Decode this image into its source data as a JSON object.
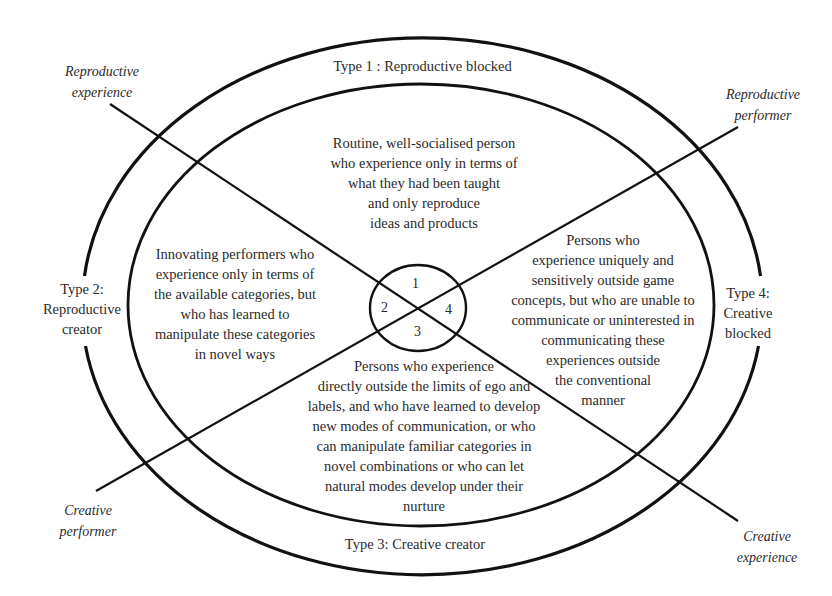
{
  "diagram": {
    "type_labels": {
      "type1": "Type 1 : Reproductive blocked",
      "type2": "Type 2:\nReproductive\ncreator",
      "type3": "Type 3: Creative creator",
      "type4": "Type 4:\nCreative\nblocked"
    },
    "axis_labels": {
      "reproductive_experience": "Reproductive\nexperience",
      "reproductive_performer": "Reproductive\nperformer",
      "creative_performer": "Creative\nperformer",
      "creative_experience": "Creative\nexperience"
    },
    "descriptions": {
      "quadrant1": "Routine, well-socialised person\nwho experience only in terms of\nwhat they had been taught\nand only reproduce\nideas and products",
      "quadrant2": "Innovating performers who\nexperience only in terms of\nthe available categories, but\nwho has learned to\nmanipulate these categories\nin novel ways",
      "quadrant3": "Persons who experience\ndirectly outside the limits of ego and\nlabels, and who have learned to develop\nnew modes of communication, or who\ncan manipulate familiar categories in\nnovel combinations or who can let\nnatural modes develop under their\nnurture",
      "quadrant4": "Persons who\nexperience uniquely and\nsensitively outside game\nconcepts,  but who are unable to\ncommunicate or uninterested in\ncommunicating these\nexperiences outside\nthe conventional\nmanner"
    },
    "center_numbers": [
      "1",
      "2",
      "3",
      "4"
    ],
    "colors": {
      "stroke": "#111111",
      "text": "#2a2a2a",
      "background": "#ffffff"
    }
  }
}
